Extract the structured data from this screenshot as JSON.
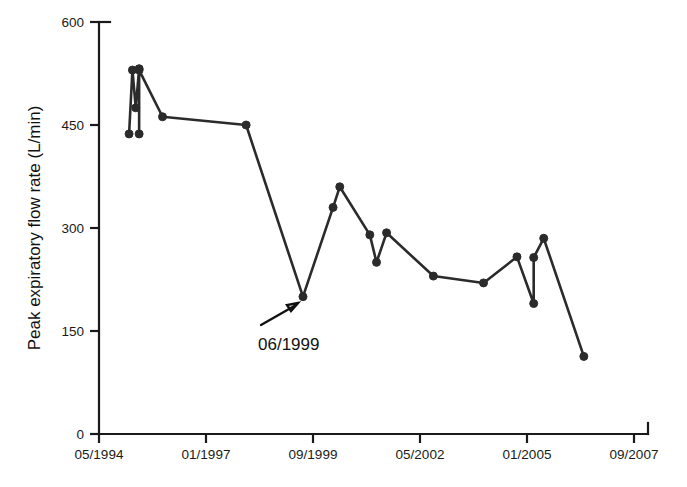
{
  "figure": {
    "background_color": "#ffffff",
    "line_color": "#2b2b2b",
    "axis_color": "#1a1a1a"
  },
  "axes": {
    "y_title": "Peak expiratory flow rate (L/min)",
    "x_title": "",
    "y_ticks": [
      "600",
      "450",
      "300",
      "150",
      "0"
    ],
    "x_ticks": [
      "05/1994",
      "01/1997",
      "09/1999",
      "05/2002",
      "01/2005",
      "09/2007"
    ]
  },
  "annotations": [
    {
      "name": "drop-annotation",
      "label": "06/1999",
      "points_to_month": 61,
      "points_to_value": 200
    }
  ],
  "chart_data": {
    "type": "line",
    "title": "",
    "xlabel": "",
    "ylabel": "Peak expiratory flow rate (L/min)",
    "ylim": [
      0,
      600
    ],
    "yticks": [
      0,
      150,
      300,
      450,
      600
    ],
    "xticks_labels": [
      "05/1994",
      "01/1997",
      "09/1999",
      "05/2002",
      "01/2005",
      "09/2007"
    ],
    "xticks_months_from_start": [
      0,
      32,
      64,
      96,
      128,
      160
    ],
    "xlim_months": [
      0,
      160
    ],
    "grid": false,
    "legend": "none",
    "marker": "filled-circle",
    "series": [
      {
        "name": "Peak expiratory flow rate",
        "points": [
          {
            "x_month": 9,
            "x_label": "02/1995",
            "y": 437
          },
          {
            "x_month": 10,
            "x_label": "03/1995",
            "y": 530
          },
          {
            "x_month": 11,
            "x_label": "04/1995",
            "y": 475
          },
          {
            "x_month": 12,
            "x_label": "05/1995",
            "y": 532
          },
          {
            "x_month": 12,
            "x_label": "05/1995",
            "y": 437
          },
          {
            "x_month": 12,
            "x_label": "05/1995",
            "y": 530
          },
          {
            "x_month": 19,
            "x_label": "12/1995",
            "y": 462
          },
          {
            "x_month": 44,
            "x_label": "01/1998",
            "y": 450
          },
          {
            "x_month": 61,
            "x_label": "06/1999",
            "y": 200
          },
          {
            "x_month": 70,
            "x_label": "03/2000",
            "y": 330
          },
          {
            "x_month": 72,
            "x_label": "05/2000",
            "y": 360
          },
          {
            "x_month": 81,
            "x_label": "02/2001",
            "y": 290
          },
          {
            "x_month": 83,
            "x_label": "04/2001",
            "y": 250
          },
          {
            "x_month": 86,
            "x_label": "07/2001",
            "y": 293
          },
          {
            "x_month": 100,
            "x_label": "09/2002",
            "y": 230
          },
          {
            "x_month": 115,
            "x_label": "12/2003",
            "y": 220
          },
          {
            "x_month": 125,
            "x_label": "10/2004",
            "y": 258
          },
          {
            "x_month": 130,
            "x_label": "03/2005",
            "y": 190
          },
          {
            "x_month": 130,
            "x_label": "03/2005",
            "y": 257
          },
          {
            "x_month": 133,
            "x_label": "06/2005",
            "y": 285
          },
          {
            "x_month": 145,
            "x_label": "06/2006",
            "y": 113
          }
        ]
      }
    ]
  }
}
